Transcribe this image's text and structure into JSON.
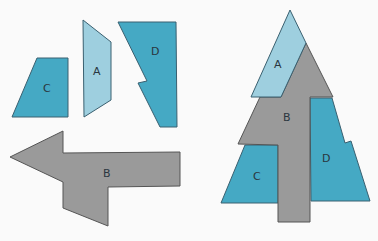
{
  "colors": {
    "light_blue": "#9ecfdf",
    "teal": "#45a9c4",
    "gray": "#9a9a9a",
    "stroke": "#4a5a66",
    "background": "#fafafa"
  },
  "pieces": {
    "A": {
      "label": "A"
    },
    "B": {
      "label": "B"
    },
    "C": {
      "label": "C"
    },
    "D": {
      "label": "D"
    }
  },
  "tree": {
    "A": {
      "label": "A"
    },
    "B": {
      "label": "B"
    },
    "C": {
      "label": "C"
    },
    "D": {
      "label": "D"
    }
  }
}
